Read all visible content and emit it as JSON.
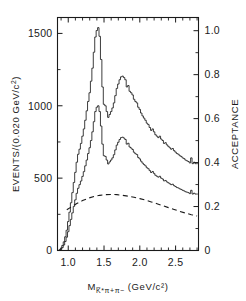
{
  "chart_data": {
    "type": "line",
    "title": "",
    "subtitle": "",
    "xlabel": "M_K̄*π+π− (GeV/c²)",
    "xlabel_parts": {
      "symbol": "M",
      "subscript": "K̅*π+π−",
      "units": "(GeV/c²)"
    },
    "ylabel": "EVENTS/(0.020 GeV/c²)",
    "ylabel_parts": {
      "main": "EVENTS/(0.020 GeV/c",
      "exponent": "2",
      "close": ")"
    },
    "y2label": "ACCEPTANCE",
    "xlim": [
      0.85,
      2.82
    ],
    "ylim": [
      0,
      1610
    ],
    "y2lim": [
      0,
      1.06
    ],
    "grid": false,
    "legend": "none",
    "xticks": [
      1.0,
      1.5,
      2.0,
      2.5
    ],
    "xtick_labels": [
      "1.0",
      "1.5",
      "2.0",
      "2.5"
    ],
    "xminorticks": [
      0.9,
      1.1,
      1.2,
      1.3,
      1.4,
      1.6,
      1.7,
      1.8,
      1.9,
      2.1,
      2.2,
      2.3,
      2.4,
      2.6,
      2.7,
      2.8
    ],
    "yticks": [
      0,
      500,
      1000,
      1500
    ],
    "ytick_labels": [
      "0",
      "500",
      "1000",
      "1500"
    ],
    "yminorticks": [
      250,
      750,
      1250
    ],
    "y2ticks": [
      0,
      0.2,
      0.4,
      0.6,
      0.8,
      1.0
    ],
    "y2tick_labels": [
      "0",
      "0.2",
      "0.4",
      "0.6",
      "0.8",
      "1.0"
    ],
    "y2minorticks": [
      0.1,
      0.3,
      0.5,
      0.7,
      0.9
    ],
    "bin_width": 0.02,
    "series": [
      {
        "name": "upper-histogram",
        "axis": "left",
        "style": "step",
        "dash": false,
        "x": [
          0.88,
          0.9,
          0.92,
          0.94,
          0.96,
          0.98,
          1.0,
          1.02,
          1.04,
          1.06,
          1.08,
          1.1,
          1.12,
          1.14,
          1.16,
          1.18,
          1.2,
          1.22,
          1.24,
          1.26,
          1.28,
          1.3,
          1.32,
          1.34,
          1.36,
          1.38,
          1.4,
          1.42,
          1.44,
          1.46,
          1.48,
          1.5,
          1.52,
          1.54,
          1.56,
          1.58,
          1.6,
          1.62,
          1.64,
          1.66,
          1.68,
          1.7,
          1.72,
          1.74,
          1.76,
          1.78,
          1.8,
          1.82,
          1.84,
          1.86,
          1.88,
          1.9,
          1.92,
          1.94,
          1.96,
          1.98,
          2.0,
          2.02,
          2.04,
          2.06,
          2.08,
          2.1,
          2.12,
          2.14,
          2.16,
          2.18,
          2.2,
          2.22,
          2.24,
          2.26,
          2.28,
          2.3,
          2.32,
          2.34,
          2.36,
          2.38,
          2.4,
          2.42,
          2.44,
          2.46,
          2.48,
          2.5,
          2.52,
          2.54,
          2.56,
          2.58,
          2.6,
          2.62,
          2.64,
          2.66,
          2.68,
          2.7,
          2.72,
          2.74,
          2.76,
          2.78,
          2.8
        ],
        "values": [
          5,
          15,
          35,
          60,
          95,
          140,
          200,
          265,
          330,
          400,
          470,
          540,
          610,
          665,
          700,
          740,
          790,
          840,
          900,
          965,
          1030,
          1090,
          1170,
          1260,
          1370,
          1475,
          1520,
          1540,
          1480,
          1320,
          1130,
          1010,
          1000,
          960,
          920,
          940,
          960,
          985,
          1020,
          1070,
          1120,
          1150,
          1180,
          1200,
          1205,
          1195,
          1180,
          1130,
          1140,
          1100,
          1090,
          1075,
          1045,
          1030,
          1020,
          990,
          975,
          950,
          930,
          915,
          900,
          880,
          870,
          850,
          830,
          840,
          820,
          800,
          790,
          780,
          790,
          770,
          760,
          740,
          745,
          730,
          720,
          710,
          700,
          705,
          690,
          680,
          670,
          665,
          655,
          650,
          640,
          635,
          625,
          620,
          615,
          605,
          640,
          600,
          610,
          600,
          600
        ]
      },
      {
        "name": "lower-histogram",
        "axis": "left",
        "style": "step",
        "dash": false,
        "x": [
          0.88,
          0.9,
          0.92,
          0.94,
          0.96,
          0.98,
          1.0,
          1.02,
          1.04,
          1.06,
          1.08,
          1.1,
          1.12,
          1.14,
          1.16,
          1.18,
          1.2,
          1.22,
          1.24,
          1.26,
          1.28,
          1.3,
          1.32,
          1.34,
          1.36,
          1.38,
          1.4,
          1.42,
          1.44,
          1.46,
          1.48,
          1.5,
          1.52,
          1.54,
          1.56,
          1.58,
          1.6,
          1.62,
          1.64,
          1.66,
          1.68,
          1.7,
          1.72,
          1.74,
          1.76,
          1.78,
          1.8,
          1.82,
          1.84,
          1.86,
          1.88,
          1.9,
          1.92,
          1.94,
          1.96,
          1.98,
          2.0,
          2.02,
          2.04,
          2.06,
          2.08,
          2.1,
          2.12,
          2.14,
          2.16,
          2.18,
          2.2,
          2.22,
          2.24,
          2.26,
          2.28,
          2.3,
          2.32,
          2.34,
          2.36,
          2.38,
          2.4,
          2.42,
          2.44,
          2.46,
          2.48,
          2.5,
          2.52,
          2.54,
          2.56,
          2.58,
          2.6,
          2.62,
          2.64,
          2.66,
          2.68,
          2.7,
          2.72,
          2.74,
          2.76,
          2.78,
          2.8
        ],
        "values": [
          2,
          8,
          20,
          38,
          62,
          92,
          130,
          172,
          215,
          260,
          305,
          350,
          395,
          430,
          455,
          480,
          512,
          545,
          585,
          625,
          670,
          710,
          760,
          820,
          890,
          960,
          990,
          1000,
          960,
          860,
          735,
          655,
          650,
          625,
          598,
          612,
          625,
          640,
          662,
          695,
          728,
          748,
          767,
          780,
          783,
          777,
          767,
          735,
          741,
          715,
          708,
          698,
          679,
          669,
          663,
          643,
          633,
          617,
          604,
          594,
          585,
          572,
          565,
          552,
          539,
          546,
          533,
          520,
          513,
          507,
          513,
          500,
          494,
          481,
          484,
          474,
          468,
          461,
          455,
          458,
          448,
          442,
          435,
          432,
          426,
          422,
          416,
          412,
          406,
          403,
          400,
          393,
          416,
          390,
          396,
          390,
          390
        ]
      },
      {
        "name": "acceptance-curve",
        "axis": "right",
        "style": "line",
        "dash": true,
        "x": [
          0.98,
          1.05,
          1.12,
          1.2,
          1.28,
          1.36,
          1.44,
          1.52,
          1.6,
          1.68,
          1.76,
          1.84,
          1.92,
          2.0,
          2.08,
          2.16,
          2.24,
          2.32,
          2.4,
          2.48,
          2.56,
          2.64,
          2.72,
          2.8
        ],
        "values": [
          0.185,
          0.2,
          0.214,
          0.227,
          0.238,
          0.246,
          0.251,
          0.254,
          0.255,
          0.254,
          0.251,
          0.247,
          0.242,
          0.236,
          0.229,
          0.221,
          0.213,
          0.204,
          0.195,
          0.187,
          0.178,
          0.17,
          0.163,
          0.157
        ]
      }
    ],
    "annotations": []
  }
}
